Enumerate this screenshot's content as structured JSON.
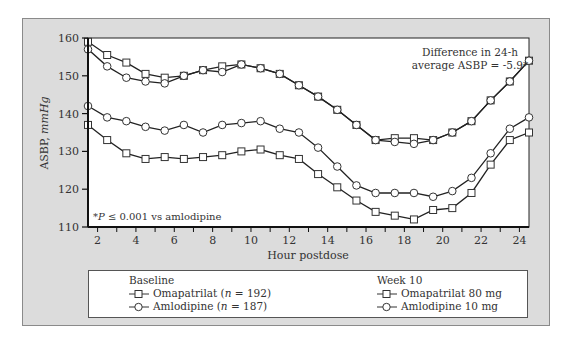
{
  "chart_data": {
    "type": "line",
    "title": "",
    "xlabel": "Hour postdose",
    "ylabel": "ASBP, mmHg",
    "ylabel_parts": {
      "main": "ASBP, ",
      "unit": "mmHg"
    },
    "ylim": [
      110,
      160
    ],
    "xlim": [
      1.5,
      24.5
    ],
    "yticks": [
      110,
      120,
      130,
      140,
      150,
      160
    ],
    "xticks": [
      2,
      4,
      6,
      8,
      10,
      12,
      14,
      16,
      18,
      20,
      22,
      24
    ],
    "grid": false,
    "x": [
      1.5,
      2.5,
      3.5,
      4.5,
      5.5,
      6.5,
      7.5,
      8.5,
      9.5,
      10.5,
      11.5,
      12.5,
      13.5,
      14.5,
      15.5,
      16.5,
      17.5,
      18.5,
      19.5,
      20.5,
      21.5,
      22.5,
      23.5,
      24.5
    ],
    "series": [
      {
        "name": "Baseline Omapatrilat (n = 192)",
        "marker": "square",
        "values": [
          159,
          155.5,
          153.5,
          150.5,
          149.5,
          150,
          151.5,
          152.5,
          153,
          152,
          150.5,
          147.5,
          144.5,
          141,
          137,
          133,
          133.5,
          133.5,
          133,
          135,
          138,
          143.5,
          148.5,
          154
        ]
      },
      {
        "name": "Baseline Amlodipine (n = 187)",
        "marker": "circle",
        "values": [
          157,
          152.5,
          149.5,
          148.5,
          148,
          150,
          151.5,
          151,
          153,
          152,
          150.5,
          147.5,
          144.5,
          141,
          137,
          133,
          132.5,
          132,
          133,
          135,
          138,
          143.5,
          148.5,
          154
        ]
      },
      {
        "name": "Week 10 Omapatrilat 80 mg",
        "marker": "square",
        "values": [
          137,
          133,
          129.5,
          128,
          128.5,
          128,
          128.5,
          129,
          130,
          130.5,
          129,
          128,
          124,
          120.5,
          117,
          114,
          113,
          112,
          114.5,
          115,
          119,
          126.5,
          133,
          135
        ]
      },
      {
        "name": "Week 10 Amlodipine 10 mg",
        "marker": "circle",
        "values": [
          142,
          139,
          138,
          136.5,
          135.5,
          137,
          135,
          137,
          137.5,
          138,
          136,
          135,
          131,
          126,
          121,
          119,
          119,
          119,
          118,
          119.5,
          123,
          129.5,
          136,
          139
        ]
      }
    ],
    "annotations": [
      {
        "text_line1": "Difference in 24-h",
        "text_line2": "average ASBP = -5.9*",
        "position": "top-right"
      },
      {
        "text_prefix": "*",
        "text_italic": "P",
        "text_rest": " ≤ 0.001 vs amlodipine",
        "position": "bottom-left"
      }
    ],
    "legend": {
      "position": "bottom",
      "groups": [
        {
          "title": "Baseline",
          "items": [
            {
              "label": "Omapatrilat (",
              "italic": "n",
              "rest": " = 192)",
              "marker": "square"
            },
            {
              "label": "Amlodipine (",
              "italic": "n",
              "rest": " = 187)",
              "marker": "circle"
            }
          ]
        },
        {
          "title": "Week 10",
          "items": [
            {
              "label": "Omapatrilat 80 mg",
              "marker": "square"
            },
            {
              "label": "Amlodipine 10 mg",
              "marker": "circle"
            }
          ]
        }
      ]
    }
  }
}
